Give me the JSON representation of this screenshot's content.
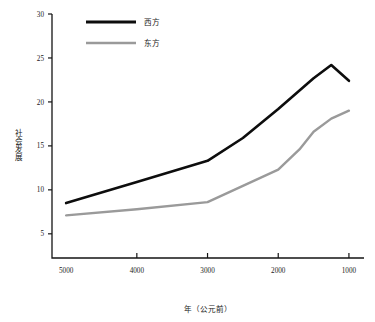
{
  "chart_data": {
    "type": "line",
    "title": "",
    "xlabel": "年（公元前）",
    "ylabel": "社会发展",
    "xlim": [
      5200,
      900
    ],
    "ylim": [
      2.2,
      30
    ],
    "x_reversed": true,
    "grid": false,
    "legend_position": "top-left",
    "x_ticks": [
      "5000",
      "4000",
      "3000",
      "2000",
      "1000"
    ],
    "x_tick_values": [
      5000,
      4000,
      3000,
      2000,
      1000
    ],
    "y_ticks": [
      "5",
      "10",
      "15",
      "20",
      "25",
      "30"
    ],
    "y_tick_values": [
      5,
      10,
      15,
      20,
      25,
      30
    ],
    "series": [
      {
        "name": "西方",
        "color": "#0d0d0d",
        "x": [
          5000,
          4000,
          3000,
          2500,
          2000,
          1500,
          1250,
          1000
        ],
        "values": [
          8.5,
          10.9,
          13.3,
          15.9,
          19.2,
          22.7,
          24.2,
          22.4
        ]
      },
      {
        "name": "东方",
        "color": "#9a9a9a",
        "x": [
          5000,
          4000,
          3000,
          2000,
          1700,
          1500,
          1250,
          1000
        ],
        "values": [
          7.1,
          7.8,
          8.6,
          12.3,
          14.6,
          16.6,
          18.1,
          19.0
        ]
      }
    ]
  },
  "legend": {
    "entries": [
      {
        "label": "西方",
        "color": "#0d0d0d"
      },
      {
        "label": "东方",
        "color": "#9a9a9a"
      }
    ]
  },
  "axes": {
    "y_title": "社会发展",
    "x_title": "年（公元前）"
  }
}
